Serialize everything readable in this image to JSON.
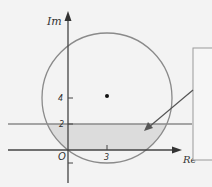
{
  "diagram": {
    "axes": {
      "x_label": "Re",
      "y_label": "Im",
      "origin_label": "O",
      "x_ticks": [
        {
          "value": 3,
          "label": "3"
        }
      ],
      "y_ticks": [
        {
          "value": 4,
          "label": "4"
        },
        {
          "value": 2,
          "label": "2"
        },
        {
          "value": -1,
          "label": ""
        }
      ]
    },
    "circle": {
      "center": [
        3,
        4
      ],
      "radius": 5
    },
    "center_point": {
      "x": 3,
      "y": 4
    },
    "horizontal_line": {
      "im": 2
    },
    "shaded_region": "inside circle, 0 <= Im <= 2",
    "callout_box": {
      "text": ""
    },
    "colors": {
      "background": "#f3f3f3",
      "axis": "#444444",
      "circle": "#8a8a8a",
      "line": "#8a8a8a",
      "shade": "#dcdcdc",
      "box": "#9a9a9a"
    }
  }
}
